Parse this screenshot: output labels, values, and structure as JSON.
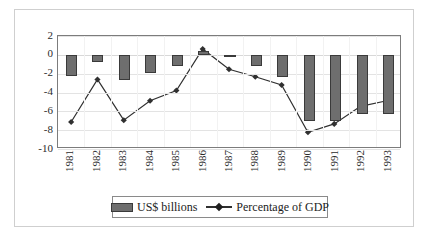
{
  "chart_data": {
    "type": "bar",
    "title": "",
    "subtitle": "",
    "xlabel": "",
    "ylabel": "",
    "ylim": [
      -10,
      2
    ],
    "yticks": [
      2,
      0,
      -2,
      -4,
      -6,
      -8,
      -10
    ],
    "ytick_labels": [
      "2",
      "0",
      "-2",
      "-4",
      "-6",
      "-8",
      "-10"
    ],
    "grid": true,
    "legend_position": "bottom",
    "categories": [
      "1981",
      "1982",
      "1983",
      "1984",
      "1985",
      "1986",
      "1987",
      "1988",
      "1989",
      "1990",
      "1991",
      "1992",
      "1993"
    ],
    "series": [
      {
        "name": "US$ billions",
        "kind": "bar",
        "color": "#6e6e6e",
        "values": [
          -2.3,
          -0.8,
          -2.7,
          -1.9,
          -1.2,
          0.4,
          -0.15,
          -1.2,
          -2.4,
          -7.0,
          -7.0,
          -6.3,
          -6.3
        ]
      },
      {
        "name": "Percentage of GDP",
        "kind": "line",
        "color": "#303030",
        "marker": "diamond",
        "values": [
          -7.3,
          -2.7,
          -7.1,
          -5.0,
          -3.9,
          0.6,
          -1.6,
          -2.4,
          -3.3,
          -8.4,
          -7.5,
          -5.6,
          -5.0
        ]
      }
    ]
  },
  "legend": {
    "bars_label": "US$ billions",
    "line_label": "Percentage of GDP"
  },
  "colors": {
    "bar_fill": "#6e6e6e",
    "bar_stroke": "#3a3a3a",
    "line": "#303030",
    "axis": "#7c7c7c",
    "grid": "#e3e3e3",
    "text": "#1c1c1c",
    "background": "#ffffff"
  }
}
